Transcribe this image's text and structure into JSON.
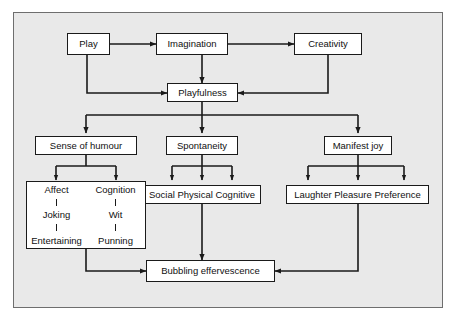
{
  "diagram": {
    "background_color": "#e9e9e9",
    "frame_border_color": "#6e6e6e",
    "box_fill_color": "#ffffff",
    "line_color": "#1a1a1a",
    "nodes": {
      "play": "Play",
      "imagination": "Imagination",
      "creativity": "Creativity",
      "playfulness": "Playfulness",
      "sense_of_humour": "Sense of humour",
      "spontaneity": "Spontaneity",
      "manifest_joy": "Manifest joy",
      "social_physical_cognitive": "Social Physical Cognitive",
      "laughter_pleasure_preference": "Laughter Pleasure Preference",
      "bubbling_effervescence": "Bubbling effervescence"
    },
    "humour_branch": {
      "affect_column": {
        "level1": "Affect",
        "level2": "Joking",
        "level3": "Entertaining"
      },
      "cognition_column": {
        "level1": "Cognition",
        "level2": "Wit",
        "level3": "Punning"
      }
    },
    "edges": [
      {
        "from": "Play",
        "to": "Imagination",
        "style": "double-arrow"
      },
      {
        "from": "Imagination",
        "to": "Creativity",
        "style": "double-arrow"
      },
      {
        "from": "Imagination",
        "to": "Playfulness",
        "style": "arrow"
      },
      {
        "from": "Play",
        "to": "Playfulness",
        "style": "arrow"
      },
      {
        "from": "Creativity",
        "to": "Playfulness",
        "style": "arrow"
      },
      {
        "from": "Playfulness",
        "to": "Sense of humour",
        "style": "arrow"
      },
      {
        "from": "Playfulness",
        "to": "Spontaneity",
        "style": "arrow"
      },
      {
        "from": "Playfulness",
        "to": "Manifest joy",
        "style": "arrow"
      },
      {
        "from": "Sense of humour",
        "to": "Affect",
        "style": "arrow"
      },
      {
        "from": "Sense of humour",
        "to": "Cognition",
        "style": "arrow"
      },
      {
        "from": "Spontaneity",
        "to": "Social",
        "style": "arrow"
      },
      {
        "from": "Spontaneity",
        "to": "Physical",
        "style": "arrow"
      },
      {
        "from": "Spontaneity",
        "to": "Cognitive",
        "style": "arrow"
      },
      {
        "from": "Manifest joy",
        "to": "Laughter",
        "style": "arrow"
      },
      {
        "from": "Manifest joy",
        "to": "Pleasure",
        "style": "arrow"
      },
      {
        "from": "Manifest joy",
        "to": "Preference",
        "style": "arrow"
      },
      {
        "from": "Sense of humour branch",
        "to": "Bubbling effervescence",
        "style": "arrow"
      },
      {
        "from": "Social Physical Cognitive",
        "to": "Bubbling effervescence",
        "style": "arrow"
      },
      {
        "from": "Laughter Pleasure Preference",
        "to": "Bubbling effervescence",
        "style": "arrow"
      }
    ]
  }
}
